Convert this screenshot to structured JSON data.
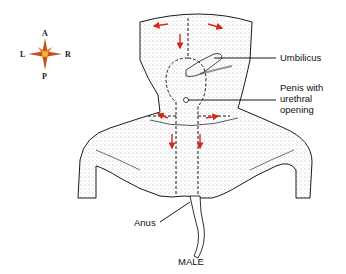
{
  "compass": {
    "anterior": "A",
    "posterior": "P",
    "left": "L",
    "right": "R",
    "colors": {
      "outer": "#c8501a",
      "inner": "#f4b030"
    }
  },
  "labels": {
    "umbilicus": "Umbilicus",
    "penis_line1": "Penis with",
    "penis_line2": "urethral",
    "penis_line3": "opening",
    "anus": "Anus",
    "caption": "MALE"
  },
  "colors": {
    "arrow": "#d42a1e",
    "outline": "#1a1a1a",
    "stipple": "#555555"
  }
}
